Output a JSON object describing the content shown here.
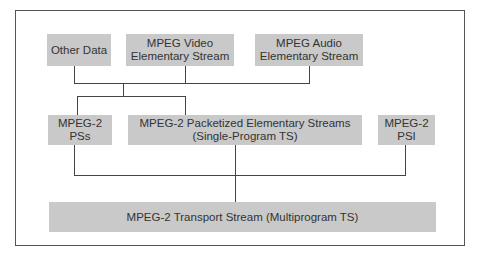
{
  "diagram": {
    "type": "hierarchy",
    "boxes": {
      "other_data": "Other Data",
      "video_line1": "MPEG Video",
      "video_line2": "Elementary Stream",
      "audio_line1": "MPEG Audio",
      "audio_line2": "Elementary Stream",
      "pss_line1": "MPEG-2",
      "pss_line2": "PSs",
      "pes_line1": "MPEG-2 Packetized Elementary Streams",
      "pes_line2": "(Single-Program TS)",
      "psi_line1": "MPEG-2",
      "psi_line2": "PSI",
      "ts": "MPEG-2 Transport Stream (Multiprogram TS)"
    },
    "colors": {
      "box_fill": "#c9c9c9",
      "line": "#444444",
      "frame": "#555555"
    }
  }
}
